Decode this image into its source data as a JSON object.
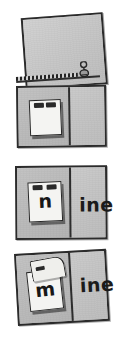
{
  "figure": {
    "description": "Four-step sequence showing a folded card with a zipper strip; a lift-flap reveals a letter that joins the fixed word ending to spell a word.",
    "background_color": "#ffffff",
    "card_color": "#c9c9c9",
    "ink_color": "#2b2b2b",
    "paper_color": "#f4f4f2"
  },
  "panels": [
    {
      "index": 1,
      "name": "open-sheet-with-zipper",
      "caption": "",
      "letter": "",
      "word_ending": "",
      "has_zipper": true,
      "flap_state": "none",
      "rotation_deg": -4.2
    },
    {
      "index": 2,
      "name": "folded-blank-card",
      "caption": "",
      "letter": "",
      "word_ending": "",
      "has_zipper": false,
      "flap_state": "closed",
      "rotation_deg": -0.8
    },
    {
      "index": 3,
      "name": "card-showing-nine",
      "caption": "",
      "letter": "n",
      "word_ending": "ine",
      "has_zipper": false,
      "flap_state": "closed",
      "rotation_deg": -0.4
    },
    {
      "index": 4,
      "name": "card-showing-mine",
      "caption": "",
      "letter": "m",
      "word_ending": "ine",
      "has_zipper": false,
      "flap_state": "lifted",
      "rotation_deg": -3.2
    }
  ],
  "zipper": {
    "name": "zipper-strip",
    "pull_label": "",
    "teeth_count": 16
  }
}
